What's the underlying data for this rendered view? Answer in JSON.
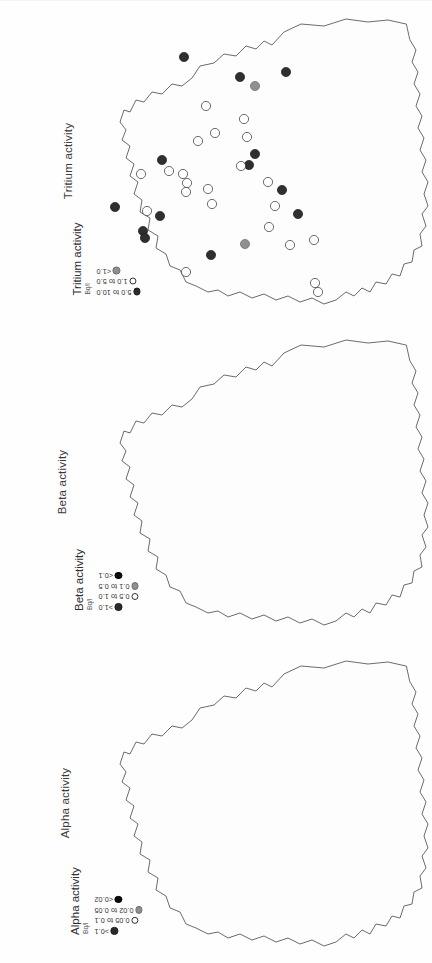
{
  "figure": {
    "background_color": "#ffffff",
    "orientation": "maps rotated 90 degrees"
  },
  "panels": [
    {
      "id": "tritium",
      "title": "Tritium activity",
      "legend": {
        "title": "Tritium activity",
        "unit": "Bq/l",
        "classes": [
          {
            "label": "5.0 to 10.0",
            "symbol": "filled-dark-circle",
            "color": "#2f2f2f"
          },
          {
            "label": "1.0 to 5.0",
            "symbol": "open-circle",
            "color": "#ffffff"
          },
          {
            "label": "<1.0",
            "symbol": "filled-grey-circle",
            "color": "#909090"
          }
        ]
      }
    },
    {
      "id": "beta",
      "title": "Beta activity",
      "legend": {
        "title": "Beta activity",
        "unit": "Bq/l",
        "classes": [
          {
            "label": ">1.0",
            "symbol": "filled-dark-circle",
            "color": "#2f2f2f"
          },
          {
            "label": "0.5 to 1.0",
            "symbol": "open-circle",
            "color": "#ffffff"
          },
          {
            "label": "0.1 to 0.5",
            "symbol": "filled-grey-circle",
            "color": "#909090"
          },
          {
            "label": "<0.1",
            "symbol": "filled-black-circle",
            "color": "#0a0a0a"
          }
        ]
      }
    },
    {
      "id": "alpha",
      "title": "Alpha activity",
      "legend": {
        "title": "Alpha activity",
        "unit": "Bq/l",
        "classes": [
          {
            "label": ">0.1",
            "symbol": "filled-dark-circle",
            "color": "#2f2f2f"
          },
          {
            "label": "0.05 to 0.1",
            "symbol": "open-circle",
            "color": "#ffffff"
          },
          {
            "label": "0.02 to 0.05",
            "symbol": "filled-grey-circle",
            "color": "#909090"
          },
          {
            "label": "<0.02",
            "symbol": "filled-black-circle",
            "color": "#0a0a0a"
          }
        ]
      }
    }
  ],
  "chart_data": {
    "type": "scatter",
    "note": "Three rotated outline maps of Great Britain, each plotting sampling sites as graduated circles.",
    "maps": [
      {
        "name": "Tritium activity",
        "unit": "Bq/l",
        "points": [
          {
            "x": 184,
            "y": 57,
            "class": "5.0 to 10.0"
          },
          {
            "x": 240,
            "y": 77,
            "class": "5.0 to 10.0"
          },
          {
            "x": 255,
            "y": 86,
            "class": "<1.0"
          },
          {
            "x": 286,
            "y": 72,
            "class": "5.0 to 10.0"
          },
          {
            "x": 206,
            "y": 106,
            "class": "1.0 to 5.0"
          },
          {
            "x": 244,
            "y": 119,
            "class": "1.0 to 5.0"
          },
          {
            "x": 247,
            "y": 137,
            "class": "1.0 to 5.0"
          },
          {
            "x": 215,
            "y": 133,
            "class": "1.0 to 5.0"
          },
          {
            "x": 198,
            "y": 141,
            "class": "1.0 to 5.0"
          },
          {
            "x": 255,
            "y": 154,
            "class": "5.0 to 10.0"
          },
          {
            "x": 249,
            "y": 165,
            "class": "5.0 to 10.0"
          },
          {
            "x": 241,
            "y": 166,
            "class": "1.0 to 5.0"
          },
          {
            "x": 162,
            "y": 160,
            "class": "5.0 to 10.0"
          },
          {
            "x": 169,
            "y": 171,
            "class": "1.0 to 5.0"
          },
          {
            "x": 141,
            "y": 174,
            "class": "1.0 to 5.0"
          },
          {
            "x": 183,
            "y": 174,
            "class": "1.0 to 5.0"
          },
          {
            "x": 187,
            "y": 183,
            "class": "1.0 to 5.0"
          },
          {
            "x": 186,
            "y": 192,
            "class": "1.0 to 5.0"
          },
          {
            "x": 208,
            "y": 189,
            "class": "1.0 to 5.0"
          },
          {
            "x": 268,
            "y": 182,
            "class": "1.0 to 5.0"
          },
          {
            "x": 282,
            "y": 190,
            "class": "5.0 to 10.0"
          },
          {
            "x": 275,
            "y": 206,
            "class": "1.0 to 5.0"
          },
          {
            "x": 212,
            "y": 204,
            "class": "1.0 to 5.0"
          },
          {
            "x": 115,
            "y": 207,
            "class": "5.0 to 10.0"
          },
          {
            "x": 147,
            "y": 211,
            "class": "1.0 to 5.0"
          },
          {
            "x": 160,
            "y": 216,
            "class": "5.0 to 10.0"
          },
          {
            "x": 143,
            "y": 231,
            "class": "5.0 to 10.0"
          },
          {
            "x": 145,
            "y": 238,
            "class": "5.0 to 10.0"
          },
          {
            "x": 298,
            "y": 214,
            "class": "5.0 to 10.0"
          },
          {
            "x": 269,
            "y": 227,
            "class": "1.0 to 5.0"
          },
          {
            "x": 245,
            "y": 244,
            "class": "<1.0"
          },
          {
            "x": 211,
            "y": 255,
            "class": "5.0 to 10.0"
          },
          {
            "x": 290,
            "y": 245,
            "class": "1.0 to 5.0"
          },
          {
            "x": 314,
            "y": 240,
            "class": "1.0 to 5.0"
          },
          {
            "x": 186,
            "y": 272,
            "class": "1.0 to 5.0"
          },
          {
            "x": 315,
            "y": 283,
            "class": "1.0 to 5.0"
          },
          {
            "x": 318,
            "y": 292,
            "class": "1.0 to 5.0"
          }
        ]
      },
      {
        "name": "Beta activity",
        "unit": "Bq/l",
        "points": [
          {
            "x": 182,
            "y": 56,
            "class": ">1.0"
          },
          {
            "x": 244,
            "y": 78,
            "class": ">1.0"
          },
          {
            "x": 252,
            "y": 88,
            "class": "<0.1"
          },
          {
            "x": 288,
            "y": 70,
            "class": ">1.0"
          },
          {
            "x": 204,
            "y": 106,
            "class": "0.1 to 0.5"
          },
          {
            "x": 246,
            "y": 120,
            "class": "0.1 to 0.5"
          },
          {
            "x": 248,
            "y": 137,
            "class": "0.5 to 1.0"
          },
          {
            "x": 216,
            "y": 133,
            "class": "0.1 to 0.5"
          },
          {
            "x": 198,
            "y": 142,
            "class": "0.1 to 0.5"
          },
          {
            "x": 255,
            "y": 153,
            "class": "0.1 to 0.5"
          },
          {
            "x": 250,
            "y": 166,
            "class": ">1.0"
          },
          {
            "x": 240,
            "y": 166,
            "class": "0.1 to 0.5"
          },
          {
            "x": 160,
            "y": 159,
            "class": ">1.0"
          },
          {
            "x": 168,
            "y": 170,
            "class": "0.1 to 0.5"
          },
          {
            "x": 140,
            "y": 173,
            "class": "0.1 to 0.5"
          },
          {
            "x": 183,
            "y": 173,
            "class": "<0.1"
          },
          {
            "x": 186,
            "y": 191,
            "class": "0.1 to 0.5"
          },
          {
            "x": 208,
            "y": 189,
            "class": "0.1 to 0.5"
          },
          {
            "x": 268,
            "y": 180,
            "class": "0.1 to 0.5"
          },
          {
            "x": 283,
            "y": 189,
            "class": "0.1 to 0.5"
          },
          {
            "x": 114,
            "y": 207,
            "class": "<0.1"
          },
          {
            "x": 147,
            "y": 210,
            "class": "<0.1"
          },
          {
            "x": 159,
            "y": 216,
            "class": ">1.0"
          },
          {
            "x": 142,
            "y": 230,
            "class": "<0.1"
          },
          {
            "x": 146,
            "y": 238,
            "class": "<0.1"
          },
          {
            "x": 297,
            "y": 213,
            "class": "0.1 to 0.5"
          },
          {
            "x": 270,
            "y": 226,
            "class": "0.1 to 0.5"
          },
          {
            "x": 246,
            "y": 243,
            "class": "0.1 to 0.5"
          },
          {
            "x": 210,
            "y": 254,
            "class": ">1.0"
          },
          {
            "x": 290,
            "y": 244,
            "class": "0.1 to 0.5"
          },
          {
            "x": 314,
            "y": 240,
            "class": "0.1 to 0.5"
          },
          {
            "x": 186,
            "y": 272,
            "class": "0.1 to 0.5"
          },
          {
            "x": 315,
            "y": 283,
            "class": "0.1 to 0.5"
          },
          {
            "x": 318,
            "y": 292,
            "class": "0.1 to 0.5"
          }
        ]
      },
      {
        "name": "Alpha activity",
        "unit": "Bq/l",
        "points": [
          {
            "x": 182,
            "y": 56,
            "class": ">0.1"
          },
          {
            "x": 244,
            "y": 78,
            "class": ">0.1"
          },
          {
            "x": 286,
            "y": 71,
            "class": ">0.1"
          },
          {
            "x": 204,
            "y": 105,
            "class": "0.05 to 0.1"
          },
          {
            "x": 248,
            "y": 100,
            "class": "0.05 to 0.1"
          },
          {
            "x": 246,
            "y": 120,
            "class": "0.02 to 0.05"
          },
          {
            "x": 248,
            "y": 137,
            "class": "<0.02"
          },
          {
            "x": 216,
            "y": 133,
            "class": ">0.1"
          },
          {
            "x": 198,
            "y": 141,
            "class": "<0.02"
          },
          {
            "x": 255,
            "y": 152,
            "class": "<0.02"
          },
          {
            "x": 250,
            "y": 165,
            "class": "<0.02"
          },
          {
            "x": 240,
            "y": 166,
            "class": "0.02 to 0.05"
          },
          {
            "x": 160,
            "y": 159,
            "class": ">0.1"
          },
          {
            "x": 168,
            "y": 170,
            "class": "0.02 to 0.05"
          },
          {
            "x": 140,
            "y": 173,
            "class": "<0.02"
          },
          {
            "x": 183,
            "y": 173,
            "class": "<0.02"
          },
          {
            "x": 186,
            "y": 191,
            "class": "0.02 to 0.05"
          },
          {
            "x": 208,
            "y": 189,
            "class": "<0.02"
          },
          {
            "x": 268,
            "y": 180,
            "class": "<0.02"
          },
          {
            "x": 283,
            "y": 189,
            "class": "<0.02"
          },
          {
            "x": 114,
            "y": 206,
            "class": "<0.02"
          },
          {
            "x": 147,
            "y": 210,
            "class": ">0.1"
          },
          {
            "x": 159,
            "y": 215,
            "class": ">0.1"
          },
          {
            "x": 142,
            "y": 230,
            "class": "<0.02"
          },
          {
            "x": 146,
            "y": 238,
            "class": "<0.02"
          },
          {
            "x": 297,
            "y": 212,
            "class": "<0.02"
          },
          {
            "x": 270,
            "y": 226,
            "class": "0.02 to 0.05"
          },
          {
            "x": 246,
            "y": 243,
            "class": "<0.02"
          },
          {
            "x": 210,
            "y": 253,
            "class": ">0.1"
          },
          {
            "x": 290,
            "y": 244,
            "class": "<0.02"
          },
          {
            "x": 314,
            "y": 239,
            "class": "<0.02"
          },
          {
            "x": 186,
            "y": 272,
            "class": "0.02 to 0.05"
          },
          {
            "x": 315,
            "y": 283,
            "class": "0.02 to 0.05"
          },
          {
            "x": 318,
            "y": 292,
            "class": "0.02 to 0.05"
          }
        ]
      }
    ]
  }
}
